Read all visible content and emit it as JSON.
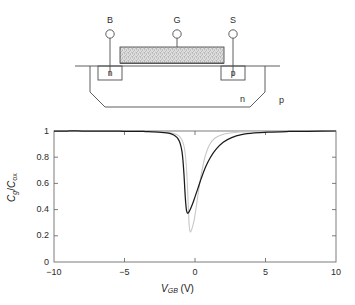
{
  "figure": {
    "device": {
      "terminals": [
        {
          "name": "bulk",
          "label": "B",
          "x": 110
        },
        {
          "name": "gate",
          "label": "G",
          "x": 177
        },
        {
          "name": "source",
          "label": "S",
          "x": 233
        }
      ],
      "diffusions": [
        {
          "name": "n-plus-contact",
          "label": "n",
          "x": 110
        },
        {
          "name": "p-plus-contact",
          "label": "p",
          "x": 233
        }
      ],
      "regions": [
        {
          "name": "n-well",
          "label": "n",
          "x": 243,
          "y": 100
        },
        {
          "name": "p-substrate",
          "label": "p",
          "x": 281,
          "y": 101
        }
      ],
      "gate_fill": "#d8d8d8",
      "line_color": "#4d4d4d"
    },
    "plot": {
      "curve_primary_color": "#1a1a1a",
      "curve_secondary_color": "#c8c8c8"
    }
  },
  "chart_data": {
    "type": "line",
    "title": "",
    "xlabel": "V_GB (V)",
    "xlabel_parts": {
      "main": "V",
      "sub": "GB",
      "unit": "(V)"
    },
    "ylabel": "C_g/C_ox",
    "ylabel_parts": {
      "num": "C",
      "num_sub": "g",
      "den": "C",
      "den_sub": "ox"
    },
    "xlim": [
      -10,
      10
    ],
    "ylim": [
      0,
      1
    ],
    "xticks": [
      -10,
      -5,
      0,
      5,
      10
    ],
    "xticklabels": [
      "−10",
      "−5",
      "0",
      "5",
      "10"
    ],
    "yticks": [
      0,
      0.2,
      0.4,
      0.6,
      0.8,
      1
    ],
    "yticklabels": [
      "0",
      "0.2",
      "0.4",
      "0.6",
      "0.8",
      "1"
    ],
    "grid": false,
    "legend": "none",
    "series": [
      {
        "name": "high-frequency C-V (dark)",
        "color": "#1a1a1a",
        "minimum": {
          "x": -0.7,
          "y": 0.37
        },
        "x": [
          -10,
          -9,
          -8,
          -7,
          -6,
          -5,
          -4,
          -3.5,
          -3,
          -2.6,
          -2.2,
          -1.9,
          -1.6,
          -1.4,
          -1.25,
          -1.1,
          -1.0,
          -0.92,
          -0.85,
          -0.78,
          -0.72,
          -0.66,
          -0.6,
          -0.52,
          -0.42,
          -0.3,
          -0.15,
          0.0,
          0.2,
          0.45,
          0.75,
          1.1,
          1.5,
          2.0,
          2.6,
          3.3,
          4.2,
          5.2,
          6.5,
          8.0,
          10
        ],
        "y": [
          1.0,
          1.0,
          1.0,
          0.999,
          0.999,
          0.998,
          0.997,
          0.996,
          0.994,
          0.992,
          0.988,
          0.983,
          0.974,
          0.962,
          0.948,
          0.92,
          0.885,
          0.84,
          0.77,
          0.665,
          0.55,
          0.452,
          0.392,
          0.372,
          0.383,
          0.41,
          0.45,
          0.497,
          0.56,
          0.64,
          0.725,
          0.8,
          0.862,
          0.915,
          0.95,
          0.972,
          0.985,
          0.992,
          0.996,
          0.998,
          1.0
        ]
      },
      {
        "name": "low-frequency C-V (light gray)",
        "color": "#c8c8c8",
        "minimum": {
          "x": -0.42,
          "y": 0.23
        },
        "x": [
          -10,
          -9,
          -8,
          -7,
          -6,
          -5,
          -4,
          -3.5,
          -3,
          -2.6,
          -2.2,
          -1.9,
          -1.6,
          -1.35,
          -1.15,
          -1.0,
          -0.88,
          -0.78,
          -0.7,
          -0.62,
          -0.55,
          -0.48,
          -0.42,
          -0.36,
          -0.3,
          -0.24,
          -0.16,
          -0.06,
          0.06,
          0.22,
          0.42,
          0.68,
          1.0,
          1.4,
          1.9,
          2.5,
          3.2,
          4.1,
          5.2,
          6.6,
          8.2,
          10
        ],
        "y": [
          1.0,
          1.0,
          1.0,
          1.0,
          0.999,
          0.999,
          0.998,
          0.997,
          0.996,
          0.995,
          0.992,
          0.989,
          0.983,
          0.975,
          0.963,
          0.945,
          0.92,
          0.885,
          0.83,
          0.74,
          0.61,
          0.44,
          0.29,
          0.235,
          0.232,
          0.245,
          0.275,
          0.32,
          0.4,
          0.52,
          0.655,
          0.79,
          0.89,
          0.945,
          0.972,
          0.985,
          0.992,
          0.996,
          0.998,
          0.999,
          1.0,
          1.0
        ]
      }
    ]
  }
}
